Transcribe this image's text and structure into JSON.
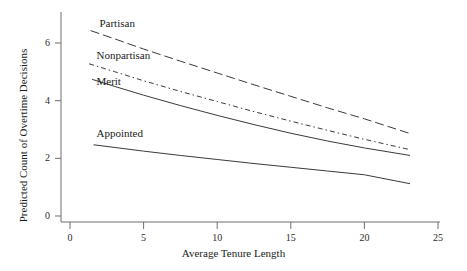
{
  "chart_data": {
    "type": "line",
    "title": "",
    "xlabel": "Average Tenure Length",
    "ylabel": "Predicted Count of Overtime Decisions",
    "xlim": [
      0,
      25
    ],
    "ylim": [
      0,
      6.9
    ],
    "xticks": [
      0,
      5,
      10,
      15,
      20,
      25
    ],
    "xtick_labels": [
      "0",
      "5",
      "10",
      "15",
      "20",
      "25"
    ],
    "yticks": [
      0,
      2,
      4,
      6
    ],
    "ytick_labels": [
      "0",
      "2",
      "4",
      "6"
    ],
    "grid": false,
    "legend_position": "inline-labels",
    "line_color": "#3a3a3a",
    "series": [
      {
        "name": "Partisan",
        "style": "long-dash",
        "label_x": 2.0,
        "label_y": 6.65,
        "x": [
          1.4,
          3.0,
          5.0,
          7.5,
          10.0,
          12.5,
          15.0,
          17.5,
          20.0,
          23.1
        ],
        "y": [
          6.43,
          6.15,
          5.79,
          5.37,
          4.96,
          4.55,
          4.15,
          3.75,
          3.37,
          2.86
        ]
      },
      {
        "name": "Nonpartisan",
        "style": "dash-dot",
        "label_x": 1.8,
        "label_y": 5.56,
        "x": [
          1.3,
          3.0,
          5.0,
          7.5,
          10.0,
          12.5,
          15.0,
          17.5,
          20.0,
          23.1
        ],
        "y": [
          5.28,
          5.01,
          4.69,
          4.32,
          3.97,
          3.62,
          3.29,
          2.97,
          2.66,
          2.3
        ]
      },
      {
        "name": "Merit",
        "style": "solid",
        "label_x": 1.8,
        "label_y": 4.66,
        "x": [
          1.5,
          3.0,
          5.0,
          7.5,
          10.0,
          12.5,
          15.0,
          17.5,
          20.0,
          23.1
        ],
        "y": [
          4.74,
          4.5,
          4.19,
          3.83,
          3.49,
          3.17,
          2.87,
          2.6,
          2.36,
          2.1
        ]
      },
      {
        "name": "Appointed",
        "style": "solid",
        "label_x": 1.8,
        "label_y": 2.86,
        "x": [
          1.6,
          3.0,
          5.0,
          7.5,
          10.0,
          12.5,
          15.0,
          17.5,
          20.0,
          23.1
        ],
        "y": [
          2.47,
          2.38,
          2.25,
          2.1,
          1.96,
          1.82,
          1.69,
          1.56,
          1.43,
          1.12
        ]
      }
    ]
  }
}
